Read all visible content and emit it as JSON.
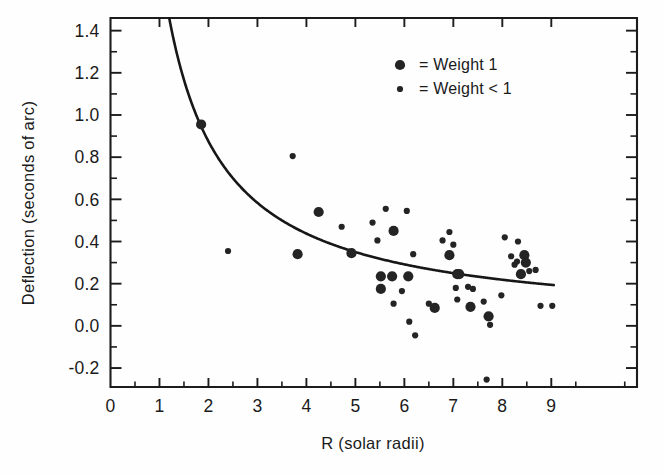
{
  "chart_data": {
    "type": "scatter",
    "title": "",
    "xlabel": "R (solar radii)",
    "ylabel": "Deflection (seconds of arc)",
    "xlim": [
      0,
      10.75
    ],
    "ylim": [
      -0.29,
      1.46
    ],
    "grid": false,
    "x_ticks": [
      0,
      1,
      2,
      3,
      4,
      5,
      6,
      7,
      8,
      9
    ],
    "x_tick_labels": [
      "0",
      "1",
      "2",
      "3",
      "4",
      "5",
      "6",
      "7",
      "8",
      "9"
    ],
    "x_minor_step": 0.5,
    "y_ticks": [
      -0.2,
      0.0,
      0.2,
      0.4,
      0.6,
      0.8,
      1.0,
      1.2,
      1.4
    ],
    "y_tick_labels": [
      "-0.2",
      "0.0",
      "0.2",
      "0.4",
      "0.6",
      "0.8",
      "1.0",
      "1.2",
      "1.4"
    ],
    "y_minor_step": 0.1,
    "legend_position": "top-right",
    "series": [
      {
        "name": "Weight 1",
        "marker": "large-filled-circle",
        "marker_radius_px": 5.1,
        "color": "#242424",
        "points": [
          [
            1.85,
            0.955
          ],
          [
            3.82,
            0.34
          ],
          [
            4.25,
            0.54
          ],
          [
            4.92,
            0.345
          ],
          [
            5.52,
            0.235
          ],
          [
            5.52,
            0.175
          ],
          [
            5.75,
            0.235
          ],
          [
            5.78,
            0.45
          ],
          [
            6.08,
            0.235
          ],
          [
            6.62,
            0.085
          ],
          [
            6.92,
            0.335
          ],
          [
            7.08,
            0.245
          ],
          [
            7.12,
            0.245
          ],
          [
            7.35,
            0.09
          ],
          [
            7.72,
            0.045
          ],
          [
            8.38,
            0.245
          ],
          [
            8.45,
            0.335
          ],
          [
            8.48,
            0.3
          ]
        ]
      },
      {
        "name": "Weight < 1",
        "marker": "small-filled-circle",
        "marker_radius_px": 3.1,
        "color": "#242424",
        "points": [
          [
            2.4,
            0.355
          ],
          [
            3.72,
            0.805
          ],
          [
            4.72,
            0.47
          ],
          [
            5.35,
            0.49
          ],
          [
            5.45,
            0.405
          ],
          [
            5.62,
            0.555
          ],
          [
            5.78,
            0.105
          ],
          [
            5.95,
            0.165
          ],
          [
            6.05,
            0.545
          ],
          [
            6.1,
            0.02
          ],
          [
            6.18,
            0.34
          ],
          [
            6.22,
            -0.045
          ],
          [
            6.5,
            0.105
          ],
          [
            6.78,
            0.405
          ],
          [
            6.92,
            0.445
          ],
          [
            7.0,
            0.385
          ],
          [
            7.05,
            0.18
          ],
          [
            7.08,
            0.125
          ],
          [
            7.3,
            0.185
          ],
          [
            7.4,
            0.175
          ],
          [
            7.62,
            0.115
          ],
          [
            7.68,
            -0.255
          ],
          [
            7.75,
            0.005
          ],
          [
            7.98,
            0.145
          ],
          [
            8.05,
            0.42
          ],
          [
            8.18,
            0.33
          ],
          [
            8.25,
            0.29
          ],
          [
            8.3,
            0.305
          ],
          [
            8.32,
            0.4
          ],
          [
            8.55,
            0.26
          ],
          [
            8.68,
            0.265
          ],
          [
            8.78,
            0.095
          ],
          [
            9.02,
            0.095
          ]
        ]
      }
    ],
    "fit_curve": {
      "name": "Einstein prediction",
      "form": "1.75 / R",
      "x_start": 1.2,
      "x_end": 9.05,
      "coefficient": 1.75,
      "style": "solid",
      "color": "#171717"
    }
  },
  "legend": {
    "entries": [
      {
        "marker": "large-filled-circle",
        "label": "= Weight 1"
      },
      {
        "marker": "small-filled-circle",
        "label": "= Weight < 1"
      }
    ]
  }
}
